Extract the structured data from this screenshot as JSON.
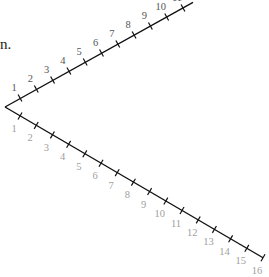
{
  "fragment_text": "n.",
  "diagram": {
    "type": "two-rays-from-vertex-with-numbered-ticks",
    "vertex": [
      5,
      107
    ],
    "upper_ray": {
      "direction": "up-right",
      "label_color": "#555555",
      "tick_labels": [
        "1",
        "2",
        "3",
        "4",
        "5",
        "6",
        "7",
        "8",
        "9",
        "10",
        "11"
      ],
      "first_tick": [
        20,
        98
      ],
      "step": [
        16.3,
        -9.0
      ]
    },
    "lower_ray": {
      "direction": "down-right",
      "label_color": "#a0a0a0",
      "tick_labels": [
        "1",
        "2",
        "3",
        "4",
        "5",
        "6",
        "7",
        "8",
        "9",
        "10",
        "11",
        "12",
        "13",
        "14",
        "15",
        "16"
      ],
      "first_tick": [
        20,
        116
      ],
      "step": [
        16.2,
        9.45
      ]
    }
  }
}
